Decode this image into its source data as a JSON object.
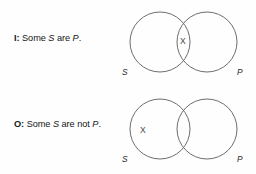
{
  "page": {
    "background_color": "#fefefe",
    "width": 256,
    "height": 174
  },
  "propositions": [
    {
      "id": "I",
      "letter": "I:",
      "statement_prefix": "Some",
      "subject_term": "S",
      "statement_middle": "are",
      "predicate_term": "P",
      "statement_suffix": ".",
      "full_text": "I: Some S are P.",
      "diagram": {
        "type": "venn-two-circle",
        "left_circle_label": "S",
        "right_circle_label": "P",
        "marks": [
          {
            "symbol": "X",
            "region": "intersection"
          }
        ],
        "stroke_color": "#6d6d6d"
      }
    },
    {
      "id": "O",
      "letter": "O:",
      "statement_prefix": "Some",
      "subject_term": "S",
      "statement_middle": "are not",
      "predicate_term": "P",
      "statement_suffix": ".",
      "full_text": "O: Some S are not P.",
      "diagram": {
        "type": "venn-two-circle",
        "left_circle_label": "S",
        "right_circle_label": "P",
        "marks": [
          {
            "symbol": "X",
            "region": "subject-only"
          }
        ],
        "stroke_color": "#6d6d6d"
      }
    }
  ]
}
